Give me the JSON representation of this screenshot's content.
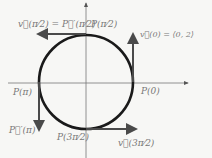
{
  "diagram": {
    "colors": {
      "background": "#f7f7f5",
      "circle": "#1a1a1a",
      "axis": "#555555",
      "vector": "#4a4a4a",
      "label": "#777777"
    },
    "labels": {
      "top_vector": "v⃗(π⁄2) = P⃗′(π⁄2)",
      "top_point": "P(π⁄2)",
      "right_vector": "v⃗(0) = ⟨0, 2⟩",
      "right_point": "P(0)",
      "left_point": "P(π)",
      "left_vector": "P⃗′(π)",
      "bottom_point": "P(3π⁄2)",
      "bottom_vector": "v⃗(3π⁄2)"
    }
  }
}
